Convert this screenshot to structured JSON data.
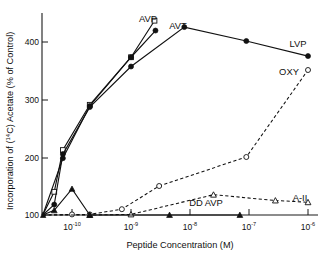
{
  "chart_data": {
    "type": "line",
    "title": "",
    "xlabel": "Peptide Concentration  (M)",
    "ylabel": "Incorporation of (14C) Acetate (% of Control)",
    "ylabel_prefix": "Incorporation of (",
    "ylabel_sup": "14",
    "ylabel_suffix": "C) Acetate (% of Control)",
    "xscale": "log",
    "xlim": [
      3.2e-11,
      1e-06
    ],
    "ylim": [
      100,
      440
    ],
    "grid": false,
    "legend_position": "inline-annotations",
    "xticklabels": [
      "10-10",
      "10-9",
      "10-8",
      "10-7",
      "10-6"
    ],
    "xtick_base": "10",
    "xtick_exponents": [
      "-10",
      "-9",
      "-8",
      "-7",
      "-6"
    ],
    "xtick_values": [
      1e-10,
      1e-09,
      1e-08,
      1e-07,
      1e-06
    ],
    "yticklabels": [
      "100",
      "200",
      "300",
      "400"
    ],
    "ytick_values": [
      100,
      200,
      300,
      400
    ],
    "series": [
      {
        "name": "AVP",
        "label": "AVP",
        "marker": "open-square",
        "linestyle": "solid",
        "x": [
          3.2e-11,
          5e-11,
          7e-11,
          2e-10,
          1e-09,
          2.5e-09
        ],
        "y": [
          100,
          140,
          212,
          290,
          372,
          435
        ]
      },
      {
        "name": "AVT",
        "label": "AVT",
        "marker": "filled-circle",
        "linestyle": "solid",
        "x": [
          3.2e-11,
          7e-11,
          2e-10,
          1e-09,
          2.6e-09
        ],
        "y": [
          100,
          198,
          288,
          372,
          418
        ]
      },
      {
        "name": "LVP",
        "label": "LVP",
        "marker": "filled-circle",
        "linestyle": "solid",
        "x": [
          3.2e-11,
          5e-11,
          7e-11,
          2e-10,
          1e-09,
          8e-09,
          9e-08,
          1e-06
        ],
        "y": [
          100,
          118,
          205,
          286,
          356,
          424,
          400,
          374
        ]
      },
      {
        "name": "OXY",
        "label": "OXY",
        "marker": "open-circle",
        "linestyle": "dashed",
        "x": [
          3.2e-11,
          1e-10,
          2e-10,
          7e-10,
          3e-09,
          9e-08,
          1e-06
        ],
        "y": [
          100,
          101,
          101,
          110,
          150,
          200,
          350
        ]
      },
      {
        "name": "A-II",
        "label": "A-II",
        "marker": "open-triangle",
        "linestyle": "dashed",
        "x": [
          3.2e-11,
          2e-10,
          1e-09,
          2.5e-08,
          2.8e-07,
          1e-06
        ],
        "y": [
          100,
          100,
          101,
          135,
          125,
          122
        ]
      },
      {
        "name": "DD AVP",
        "label": "DD AVP",
        "marker": "filled-triangle",
        "linestyle": "solid",
        "x": [
          3.2e-11,
          5e-11,
          1e-10,
          2e-10,
          4.5e-09,
          7e-08
        ],
        "y": [
          100,
          108,
          145,
          100,
          100,
          100
        ]
      }
    ],
    "annotations": [
      {
        "text": "AVP",
        "x_px": 148,
        "y_px": 22
      },
      {
        "text": "AVT",
        "x_px": 178,
        "y_px": 29
      },
      {
        "text": "LVP",
        "x_px": 298,
        "y_px": 47
      },
      {
        "text": "OXY",
        "x_px": 289,
        "y_px": 75
      },
      {
        "text": "A-II",
        "x_px": 300,
        "y_px": 201
      },
      {
        "text": "DD AVP",
        "x_px": 206,
        "y_px": 206
      }
    ]
  }
}
